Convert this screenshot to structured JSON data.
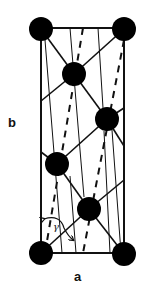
{
  "diagram": {
    "type": "crystal-lattice-unit-cell",
    "labels": {
      "horizontal_axis": "a",
      "vertical_axis": "b",
      "angle": "γ"
    },
    "colors": {
      "stroke": "#111111",
      "atom_fill": "#000000",
      "background": "#ffffff"
    },
    "cell": {
      "x1": 41,
      "y1": 28,
      "x2": 124,
      "y2": 253
    },
    "atoms": [
      {
        "id": "corner-top-left",
        "cx": 41,
        "cy": 29,
        "r": 12
      },
      {
        "id": "corner-top-right",
        "cx": 124,
        "cy": 29,
        "r": 12
      },
      {
        "id": "corner-bottom-left",
        "cx": 41,
        "cy": 253,
        "r": 12
      },
      {
        "id": "corner-bottom-right",
        "cx": 124,
        "cy": 254,
        "r": 12
      },
      {
        "id": "interior-1",
        "cx": 74,
        "cy": 74,
        "r": 12
      },
      {
        "id": "interior-2",
        "cx": 107,
        "cy": 119,
        "r": 12
      },
      {
        "id": "interior-3",
        "cx": 57,
        "cy": 164,
        "r": 12
      },
      {
        "id": "interior-4",
        "cx": 89,
        "cy": 209,
        "r": 12
      }
    ],
    "bonds": [
      {
        "x1": 41,
        "y1": 29,
        "x2": 74,
        "y2": 74
      },
      {
        "x1": 124,
        "y1": 29,
        "x2": 74,
        "y2": 74
      },
      {
        "x1": 74,
        "y1": 74,
        "x2": 107,
        "y2": 119
      },
      {
        "x1": 74,
        "y1": 74,
        "x2": 41,
        "y2": 101
      },
      {
        "x1": 107,
        "y1": 119,
        "x2": 124,
        "y2": 108
      },
      {
        "x1": 107,
        "y1": 119,
        "x2": 57,
        "y2": 164
      },
      {
        "x1": 107,
        "y1": 119,
        "x2": 124,
        "y2": 146
      },
      {
        "x1": 57,
        "y1": 164,
        "x2": 41,
        "y2": 152
      },
      {
        "x1": 57,
        "y1": 164,
        "x2": 89,
        "y2": 209
      },
      {
        "x1": 89,
        "y1": 209,
        "x2": 124,
        "y2": 180
      },
      {
        "x1": 89,
        "y1": 209,
        "x2": 41,
        "y2": 253
      },
      {
        "x1": 89,
        "y1": 209,
        "x2": 124,
        "y2": 254
      }
    ],
    "thin_lines": [
      {
        "x1": 45,
        "y1": 40,
        "x2": 62,
        "y2": 253
      },
      {
        "x1": 70,
        "y1": 28,
        "x2": 80,
        "y2": 150
      },
      {
        "x1": 80,
        "y1": 150,
        "x2": 84,
        "y2": 197
      },
      {
        "x1": 98,
        "y1": 28,
        "x2": 103,
        "y2": 108
      },
      {
        "x1": 104,
        "y1": 131,
        "x2": 110,
        "y2": 253
      },
      {
        "x1": 70,
        "y1": 176,
        "x2": 76,
        "y2": 253
      },
      {
        "x1": 112,
        "y1": 130,
        "x2": 121,
        "y2": 253
      }
    ],
    "dashed_lines": [
      {
        "x1": 83,
        "y1": 28,
        "x2": 45,
        "y2": 253
      },
      {
        "x1": 124,
        "y1": 40,
        "x2": 83,
        "y2": 253
      }
    ],
    "angle_arrow": {
      "path": "M44 219 Q60 214 64 228 Q68 236 73 240",
      "arrow_head_start": {
        "x": 44,
        "y": 219
      },
      "arrow_head_end": {
        "x": 73,
        "y": 240
      }
    }
  }
}
